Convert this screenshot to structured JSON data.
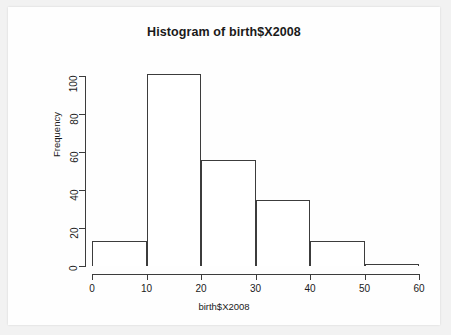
{
  "chart_data": {
    "type": "bar",
    "title": "Histogram of birth$X2008",
    "xlabel": "birth$X2008",
    "ylabel": "Frequency",
    "bin_width": 10,
    "bin_edges": [
      0,
      10,
      20,
      30,
      40,
      50,
      60
    ],
    "categories": [
      "0-10",
      "10-20",
      "20-30",
      "30-40",
      "40-50",
      "50-60"
    ],
    "values": [
      13,
      101,
      56,
      35,
      13,
      1
    ],
    "bars": [
      {
        "x0": 0,
        "x1": 10,
        "value": 13
      },
      {
        "x0": 10,
        "x1": 20,
        "value": 101
      },
      {
        "x0": 20,
        "x1": 30,
        "value": 56
      },
      {
        "x0": 30,
        "x1": 40,
        "value": 35
      },
      {
        "x0": 40,
        "x1": 50,
        "value": 13
      },
      {
        "x0": 50,
        "x1": 60,
        "value": 1
      }
    ],
    "xlim": [
      0,
      60
    ],
    "ylim": [
      0,
      101
    ],
    "xticks": [
      0,
      10,
      20,
      30,
      40,
      50,
      60
    ],
    "xtick_labels": [
      "0",
      "10",
      "20",
      "30",
      "40",
      "50",
      "60"
    ],
    "yticks": [
      0,
      20,
      40,
      60,
      80,
      100
    ],
    "ytick_labels": [
      "0",
      "20",
      "40",
      "60",
      "80",
      "100"
    ],
    "grid": false,
    "legend": null,
    "bar_fill_color": "#ffffff",
    "bar_edge_color": "#3c3c3c",
    "axis_color": "#3c3c3c",
    "background_color": "#fefefe"
  }
}
